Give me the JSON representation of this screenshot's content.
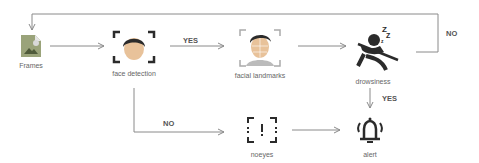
{
  "nodes": {
    "frames": {
      "label": "Frames",
      "icon": "image-file-icon"
    },
    "face_detection": {
      "label": "face detection",
      "icon": "face-detection-icon"
    },
    "facial_landmarks": {
      "label": "facial landmarks",
      "icon": "face-mesh-icon"
    },
    "drowsiness": {
      "label": "drowsiness",
      "icon": "sleeping-driver-icon"
    },
    "noeyes": {
      "label": "noeyes",
      "icon": "warning-frame-icon"
    },
    "alert": {
      "label": "alert",
      "icon": "bell-alarm-icon"
    }
  },
  "edges": {
    "frames_to_face": {
      "label": ""
    },
    "face_to_landmarks": {
      "label": "YES"
    },
    "landmarks_to_drowsiness": {
      "label": ""
    },
    "drowsiness_to_frames": {
      "label": "NO"
    },
    "drowsiness_to_alert": {
      "label": "YES"
    },
    "face_to_noeyes": {
      "label": "NO"
    },
    "noeyes_to_alert": {
      "label": ""
    }
  },
  "colors": {
    "line": "#8a8a8a",
    "icon_dark": "#2b2b2b",
    "frames_fill": "#9aa37a",
    "skin": "#e8c29a"
  }
}
